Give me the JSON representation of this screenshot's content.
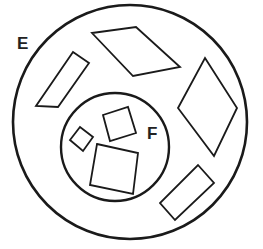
{
  "diagram": {
    "type": "venn-nested-sets",
    "stroke_color": "#1a1a1a",
    "background": "#ffffff",
    "sets": [
      {
        "id": "E",
        "label": "E",
        "role": "outer-set",
        "circle": {
          "cx": 130,
          "cy": 122,
          "r": 117
        },
        "label_pos": {
          "x": 17,
          "y": 49
        }
      },
      {
        "id": "F",
        "label": "F",
        "role": "inner-subset",
        "circle": {
          "cx": 115,
          "cy": 147,
          "r": 54
        },
        "label_pos": {
          "x": 147,
          "y": 139
        }
      }
    ],
    "shapes": [
      {
        "name": "parallelogram-left",
        "in_set": "E",
        "kind": "parallelogram",
        "points": "73,52 89,63 58,107 36,106"
      },
      {
        "name": "rhombus-top",
        "in_set": "E",
        "kind": "rhombus",
        "points": "92,33 136,27 180,67 133,76"
      },
      {
        "name": "rhombus-right",
        "in_set": "E",
        "kind": "rhombus",
        "points": "205,58 237,108 214,156 178,108"
      },
      {
        "name": "rectangle-bottom-right",
        "in_set": "E",
        "kind": "rectangle",
        "points": "198,165 214,183 175,220 160,203"
      },
      {
        "name": "square-small",
        "in_set": "F",
        "kind": "square",
        "points": "70,140 80,127 93,137 83,151"
      },
      {
        "name": "square-medium",
        "in_set": "F",
        "kind": "square",
        "points": "103,115 128,107 136,133 110,141"
      },
      {
        "name": "square-large",
        "in_set": "F",
        "kind": "square",
        "points": "97,144 138,153 133,194 90,185"
      }
    ]
  }
}
